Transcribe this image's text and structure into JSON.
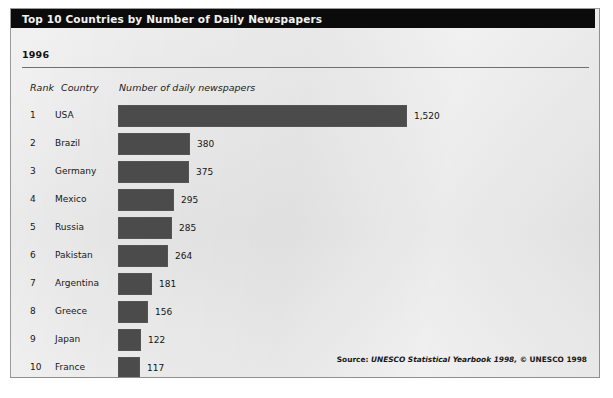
{
  "figure": {
    "title": "Top 10 Countries by Number of Daily Newspapers",
    "year": "1996",
    "columns": {
      "rank": "Rank",
      "country": "Country",
      "value": "Number of daily newspapers"
    },
    "source": {
      "label": "Source:",
      "title": "UNESCO Statistical Yearbook 1998,",
      "copyright": "© UNESCO 1998"
    },
    "colors": {
      "bar": "#4b4b4b",
      "title_bar": "#0b0b0b",
      "title_text": "#f2f2f2",
      "card_background": "#e8e8e8",
      "page_background": "#ffffff"
    }
  },
  "chart_data": {
    "type": "bar",
    "orientation": "horizontal",
    "title": "Top 10 Countries by Number of Daily Newspapers",
    "subtitle": "1996",
    "xlabel": "Number of daily newspapers",
    "ylabel": "Country",
    "xlim": [
      0,
      1520
    ],
    "grid": false,
    "legend": false,
    "categories": [
      "USA",
      "Brazil",
      "Germany",
      "Mexico",
      "Russia",
      "Pakistan",
      "Argentina",
      "Greece",
      "Japan",
      "France"
    ],
    "values": [
      1520,
      380,
      375,
      295,
      285,
      264,
      181,
      156,
      122,
      117
    ],
    "value_labels": [
      "1,520",
      "380",
      "375",
      "295",
      "285",
      "264",
      "181",
      "156",
      "122",
      "117"
    ],
    "ranks": [
      "1",
      "2",
      "3",
      "4",
      "5",
      "6",
      "7",
      "8",
      "9",
      "10"
    ],
    "rows": [
      {
        "rank": "1",
        "country": "USA",
        "value": 1520,
        "label": "1,520"
      },
      {
        "rank": "2",
        "country": "Brazil",
        "value": 380,
        "label": "380"
      },
      {
        "rank": "3",
        "country": "Germany",
        "value": 375,
        "label": "375"
      },
      {
        "rank": "4",
        "country": "Mexico",
        "value": 295,
        "label": "295"
      },
      {
        "rank": "5",
        "country": "Russia",
        "value": 285,
        "label": "285"
      },
      {
        "rank": "6",
        "country": "Pakistan",
        "value": 264,
        "label": "264"
      },
      {
        "rank": "7",
        "country": "Argentina",
        "value": 181,
        "label": "181"
      },
      {
        "rank": "8",
        "country": "Greece",
        "value": 156,
        "label": "156"
      },
      {
        "rank": "9",
        "country": "Japan",
        "value": 122,
        "label": "122"
      },
      {
        "rank": "10",
        "country": "France",
        "value": 117,
        "label": "117"
      }
    ],
    "annotation": "Source: UNESCO Statistical Yearbook 1998, © UNESCO 1998"
  }
}
